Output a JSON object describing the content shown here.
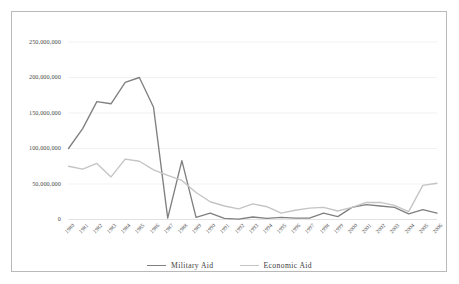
{
  "chart_data": {
    "type": "line",
    "title": "",
    "xlabel": "",
    "ylabel": "",
    "ylim": [
      0,
      250000000
    ],
    "yticks": [
      0,
      50000000,
      100000000,
      150000000,
      200000000,
      250000000
    ],
    "ytick_labels": [
      "0",
      "50,000,000",
      "100,000,000",
      "150,000,000",
      "200,000,000",
      "250,000,000"
    ],
    "grid": true,
    "grid_axis": "y",
    "legend_position": "bottom-center",
    "categories": [
      "1980",
      "1981",
      "1982",
      "1983",
      "1984",
      "1985",
      "1986",
      "1987",
      "1988",
      "1989",
      "1990",
      "1991",
      "1992",
      "1993",
      "1994",
      "1995",
      "1996",
      "1997",
      "1998",
      "1999",
      "2000",
      "2001",
      "2002",
      "2003",
      "2004",
      "2005",
      "2006"
    ],
    "series": [
      {
        "name": "Military Aid",
        "color": "#808080",
        "values": [
          100000000,
          128000000,
          166000000,
          163000000,
          193000000,
          200000000,
          158000000,
          2000000,
          83000000,
          3000000,
          9000000,
          1500000,
          500000,
          3500000,
          1500000,
          3000000,
          2000000,
          2000000,
          9000000,
          4000000,
          17000000,
          21000000,
          19000000,
          17000000,
          8000000,
          14000000,
          9000000
        ]
      },
      {
        "name": "Economic Aid",
        "color": "#c4c4c4",
        "values": [
          75000000,
          71000000,
          79000000,
          60000000,
          85000000,
          82000000,
          70000000,
          62000000,
          55000000,
          38000000,
          25000000,
          19000000,
          15000000,
          22000000,
          18000000,
          9000000,
          13000000,
          16000000,
          17000000,
          12000000,
          17000000,
          24000000,
          24000000,
          20000000,
          11000000,
          48000000,
          51000000
        ]
      }
    ]
  },
  "legend": {
    "entries": [
      {
        "label": "Military  Aid",
        "color": "#808080"
      },
      {
        "label": "Economic Aid",
        "color": "#c4c4c4"
      }
    ]
  }
}
